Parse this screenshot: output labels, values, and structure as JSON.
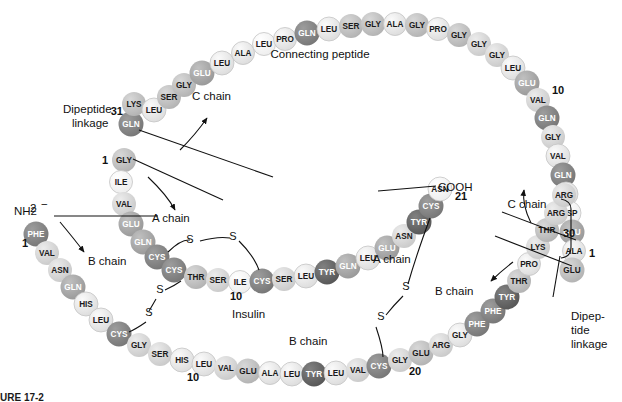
{
  "figure": {
    "caption": "URE 17-2",
    "annotations": {
      "connecting_peptide": "Connecting peptide",
      "c_chain_left": "C chain",
      "c_chain_right": "C chain",
      "a_chain_left": "A chain",
      "a_chain_right": "A chain",
      "b_chain_left": "B chain",
      "b_chain_right": "B chain",
      "insulin": "Insulin",
      "dipeptide_left": "Dipeptide\nlinkage",
      "dipeptide_left_line1": "Dipeptide",
      "dipeptide_left_line2": "linkage",
      "dipeptide_right_line1": "Dipep-",
      "dipeptide_right_line2": "tide",
      "dipeptide_right_line3": "linkage",
      "amino_terminus": "NH2",
      "amino_terminus_charge": "−",
      "carboxy_terminus": "COOH",
      "carboxy_terminus_dash": "−",
      "sulfur": "S"
    },
    "numbers": {
      "b1": "1",
      "b10": "10",
      "b20": "20",
      "b30": "30",
      "a1": "1",
      "a10": "10",
      "a21": "21",
      "c1": "1",
      "c10": "10",
      "c31": "31"
    },
    "colors": {
      "shade_lightest": "#f2f2f2",
      "shade_light": "#e3e3e3",
      "shade_mid_light": "#cfcfcf",
      "shade_mid": "#b5b5b5",
      "shade_mid_dark": "#9a9a9a",
      "shade_dark": "#7d7d7d",
      "shade_darkest": "#5e5e5e",
      "outline": "#9a9a9a",
      "text_on_dark": "#ffffff",
      "text_on_light": "#1a1a1a",
      "line": "#111111"
    }
  },
  "chains": {
    "c_chain_arc": [
      {
        "n": "GLN",
        "x": 131,
        "y": 124,
        "r": 12.5,
        "s": 5
      },
      {
        "n": "LYS",
        "x": 134,
        "y": 104,
        "r": 12,
        "s": 3
      },
      {
        "n": "LEU",
        "x": 154,
        "y": 110,
        "r": 12,
        "s": 1
      },
      {
        "n": "SER",
        "x": 169,
        "y": 97,
        "r": 12,
        "s": 3
      },
      {
        "n": "GLY",
        "x": 184,
        "y": 85,
        "r": 12,
        "s": 3
      },
      {
        "n": "GLU",
        "x": 202,
        "y": 73,
        "r": 12.5,
        "s": 4
      },
      {
        "n": "LEU",
        "x": 222,
        "y": 63,
        "r": 12,
        "s": 1
      },
      {
        "n": "ALA",
        "x": 243,
        "y": 53,
        "r": 11.5,
        "s": 1
      },
      {
        "n": "LEU",
        "x": 264,
        "y": 44,
        "r": 11.5,
        "s": 0
      },
      {
        "n": "PRO",
        "x": 285,
        "y": 39,
        "r": 11.5,
        "s": 1
      },
      {
        "n": "GLN",
        "x": 307,
        "y": 33,
        "r": 12.5,
        "s": 5
      },
      {
        "n": "LEU",
        "x": 329,
        "y": 29,
        "r": 12,
        "s": 1
      },
      {
        "n": "SER",
        "x": 351,
        "y": 26,
        "r": 12,
        "s": 3
      },
      {
        "n": "GLY",
        "x": 373,
        "y": 24,
        "r": 12,
        "s": 3
      },
      {
        "n": "ALA",
        "x": 395,
        "y": 24,
        "r": 11.5,
        "s": 1
      },
      {
        "n": "GLY",
        "x": 417,
        "y": 25,
        "r": 12,
        "s": 3
      },
      {
        "n": "PRO",
        "x": 438,
        "y": 29,
        "r": 11.5,
        "s": 1
      },
      {
        "n": "GLY",
        "x": 459,
        "y": 35,
        "r": 12,
        "s": 3
      },
      {
        "n": "GLY",
        "x": 479,
        "y": 44,
        "r": 12,
        "s": 2
      },
      {
        "n": "GLY",
        "x": 497,
        "y": 55,
        "r": 12,
        "s": 2
      },
      {
        "n": "LEU",
        "x": 513,
        "y": 68,
        "r": 12,
        "s": 1
      },
      {
        "n": "GLU",
        "x": 527,
        "y": 83,
        "r": 12.5,
        "s": 4
      },
      {
        "n": "VAL",
        "x": 538,
        "y": 100,
        "r": 12,
        "s": 2
      },
      {
        "n": "GLN",
        "x": 547,
        "y": 118,
        "r": 12.5,
        "s": 5
      },
      {
        "n": "GLY",
        "x": 553,
        "y": 137,
        "r": 12,
        "s": 2
      },
      {
        "n": "VAL",
        "x": 558,
        "y": 156,
        "r": 12,
        "s": 1
      },
      {
        "n": "GLN",
        "x": 563,
        "y": 175,
        "r": 12.5,
        "s": 5
      },
      {
        "n": "LEU",
        "x": 566,
        "y": 194,
        "r": 12,
        "s": 1
      },
      {
        "n": "ASP",
        "x": 569,
        "y": 213,
        "r": 12,
        "s": 0
      },
      {
        "n": "GLU",
        "x": 572,
        "y": 232,
        "r": 12.5,
        "s": 4
      },
      {
        "n": "ALA",
        "x": 574,
        "y": 251,
        "r": 11.5,
        "s": 1
      },
      {
        "n": "GLU",
        "x": 572,
        "y": 270,
        "r": 12.5,
        "s": 3
      }
    ],
    "a_chain": [
      {
        "n": "GLY",
        "x": 124,
        "y": 160,
        "r": 12,
        "s": 3
      },
      {
        "n": "ILE",
        "x": 121,
        "y": 182,
        "r": 11.5,
        "s": 0
      },
      {
        "n": "VAL",
        "x": 124,
        "y": 204,
        "r": 12,
        "s": 2
      },
      {
        "n": "GLU",
        "x": 131,
        "y": 224,
        "r": 12.5,
        "s": 4
      },
      {
        "n": "GLN",
        "x": 143,
        "y": 242,
        "r": 12.5,
        "s": 4
      },
      {
        "n": "CYS",
        "x": 157,
        "y": 257,
        "r": 12.5,
        "s": 5
      },
      {
        "n": "CYS",
        "x": 174,
        "y": 270,
        "r": 12.5,
        "s": 5
      },
      {
        "n": "THR",
        "x": 196,
        "y": 277,
        "r": 12,
        "s": 3
      },
      {
        "n": "SER",
        "x": 218,
        "y": 280,
        "r": 12,
        "s": 2
      },
      {
        "n": "ILE",
        "x": 240,
        "y": 282,
        "r": 11.5,
        "s": 0
      },
      {
        "n": "CYS",
        "x": 262,
        "y": 281,
        "r": 12.5,
        "s": 5
      },
      {
        "n": "SER",
        "x": 284,
        "y": 279,
        "r": 12,
        "s": 2
      },
      {
        "n": "LEU",
        "x": 306,
        "y": 276,
        "r": 12,
        "s": 1
      },
      {
        "n": "TYR",
        "x": 327,
        "y": 272,
        "r": 12.5,
        "s": 6
      },
      {
        "n": "GLN",
        "x": 348,
        "y": 266,
        "r": 12.5,
        "s": 4
      },
      {
        "n": "LEU",
        "x": 368,
        "y": 258,
        "r": 12,
        "s": 1
      },
      {
        "n": "GLU",
        "x": 387,
        "y": 248,
        "r": 12.5,
        "s": 4
      },
      {
        "n": "ASN",
        "x": 404,
        "y": 236,
        "r": 12,
        "s": 2
      },
      {
        "n": "TYR",
        "x": 419,
        "y": 222,
        "r": 12.5,
        "s": 6
      },
      {
        "n": "CYS",
        "x": 431,
        "y": 206,
        "r": 12.5,
        "s": 5
      },
      {
        "n": "ASN",
        "x": 440,
        "y": 189,
        "r": 12,
        "s": 0
      }
    ],
    "b_chain": [
      {
        "n": "PHE",
        "x": 36,
        "y": 234,
        "r": 12.5,
        "s": 5
      },
      {
        "n": "VAL",
        "x": 47,
        "y": 253,
        "r": 12,
        "s": 2
      },
      {
        "n": "ASN",
        "x": 60,
        "y": 270,
        "r": 12,
        "s": 2
      },
      {
        "n": "GLN",
        "x": 73,
        "y": 287,
        "r": 12.5,
        "s": 4
      },
      {
        "n": "HIS",
        "x": 86,
        "y": 304,
        "r": 12,
        "s": 1
      },
      {
        "n": "LEU",
        "x": 101,
        "y": 320,
        "r": 12,
        "s": 1
      },
      {
        "n": "CYS",
        "x": 119,
        "y": 334,
        "r": 12.5,
        "s": 5
      },
      {
        "n": "GLY",
        "x": 139,
        "y": 345,
        "r": 12,
        "s": 2
      },
      {
        "n": "SER",
        "x": 160,
        "y": 354,
        "r": 12,
        "s": 2
      },
      {
        "n": "HIS",
        "x": 182,
        "y": 360,
        "r": 12,
        "s": 1
      },
      {
        "n": "LEU",
        "x": 204,
        "y": 364,
        "r": 12,
        "s": 1
      },
      {
        "n": "VAL",
        "x": 226,
        "y": 368,
        "r": 12,
        "s": 2
      },
      {
        "n": "GLU",
        "x": 248,
        "y": 371,
        "r": 12.5,
        "s": 3
      },
      {
        "n": "ALA",
        "x": 270,
        "y": 373,
        "r": 11.5,
        "s": 1
      },
      {
        "n": "LEU",
        "x": 292,
        "y": 374,
        "r": 12,
        "s": 1
      },
      {
        "n": "TYR",
        "x": 314,
        "y": 374,
        "r": 12.5,
        "s": 6
      },
      {
        "n": "LEU",
        "x": 336,
        "y": 373,
        "r": 12,
        "s": 1
      },
      {
        "n": "VAL",
        "x": 358,
        "y": 370,
        "r": 12,
        "s": 2
      },
      {
        "n": "CYS",
        "x": 379,
        "y": 366,
        "r": 12.5,
        "s": 5
      },
      {
        "n": "GLY",
        "x": 400,
        "y": 360,
        "r": 12,
        "s": 2
      },
      {
        "n": "GLU",
        "x": 421,
        "y": 353,
        "r": 12.5,
        "s": 3
      },
      {
        "n": "ARG",
        "x": 441,
        "y": 345,
        "r": 12,
        "s": 2
      },
      {
        "n": "GLY",
        "x": 460,
        "y": 335,
        "r": 12,
        "s": 1
      },
      {
        "n": "PHE",
        "x": 477,
        "y": 324,
        "r": 12.5,
        "s": 5
      },
      {
        "n": "PHE",
        "x": 493,
        "y": 311,
        "r": 12.5,
        "s": 5
      },
      {
        "n": "TYR",
        "x": 507,
        "y": 297,
        "r": 12.5,
        "s": 6
      },
      {
        "n": "THR",
        "x": 519,
        "y": 281,
        "r": 12,
        "s": 3
      },
      {
        "n": "PRO",
        "x": 529,
        "y": 264,
        "r": 11.5,
        "s": 1
      },
      {
        "n": "LYS",
        "x": 538,
        "y": 247,
        "r": 12,
        "s": 2
      },
      {
        "n": "THR",
        "x": 547,
        "y": 230,
        "r": 12,
        "s": 3
      },
      {
        "n": "ARG",
        "x": 556,
        "y": 213,
        "r": 12,
        "s": 2
      },
      {
        "n": "ARG",
        "x": 564,
        "y": 195,
        "r": 12,
        "s": 2
      }
    ]
  },
  "disulfides": [
    {
      "label": "S",
      "x": 190,
      "y": 243
    },
    {
      "label": "S",
      "x": 233,
      "y": 240
    },
    {
      "label": "S",
      "x": 160,
      "y": 293
    },
    {
      "label": "S",
      "x": 149,
      "y": 316
    },
    {
      "label": "S",
      "x": 406,
      "y": 290
    },
    {
      "label": "S",
      "x": 381,
      "y": 320
    }
  ]
}
